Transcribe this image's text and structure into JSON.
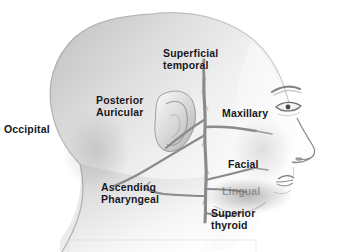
{
  "figure": {
    "background_color": "#ffffff",
    "text_color": "#16161a",
    "vessel_color": "#8a8a8c",
    "skin_light": "#fdfdfd",
    "skin_mid": "#d8d8d8",
    "skin_shadow": "#a9a9a9"
  },
  "labels": {
    "occipital": "Occipital",
    "posterior_auricular": "Posterior\nAuricular",
    "superficial_temporal": "Superficial\ntemporal",
    "maxillary": "Maxillary",
    "facial": "Facial",
    "ascending_pharyngeal": "Ascending\nPharyngeal",
    "lingual": "Lingual",
    "superior_thyroid": "Superior\nthyroid"
  },
  "anatomy": {
    "head_profile": "lateral view of a human head and neck facing right, bald scalp, visible ear, eye, nose and lips",
    "features": [
      "cranium",
      "ear",
      "eyebrow",
      "eye",
      "nose",
      "lips",
      "chin",
      "jawline",
      "neck",
      "shoulder"
    ]
  },
  "vessels": {
    "common_carotid_trunk": "vertical trunk ascending through the neck",
    "branches": [
      "superficial temporal",
      "maxillary",
      "posterior auricular",
      "occipital",
      "facial",
      "lingual",
      "ascending pharyngeal",
      "superior thyroid"
    ]
  },
  "footer": {
    "caption_rule": "faint light gray horizontal rule near the bottom edge"
  }
}
